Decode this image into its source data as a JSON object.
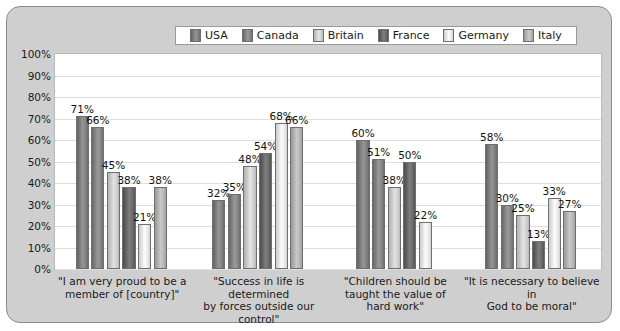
{
  "chart_data": {
    "type": "bar",
    "title": "",
    "xlabel": "",
    "ylabel": "",
    "ylim": [
      0,
      100
    ],
    "ytick_labels": [
      "100%",
      "90%",
      "80%",
      "70%",
      "60%",
      "50%",
      "40%",
      "30%",
      "20%",
      "10%",
      "0%"
    ],
    "ytick_values": [
      100,
      90,
      80,
      70,
      60,
      50,
      40,
      30,
      20,
      10,
      0
    ],
    "grid": true,
    "legend_position": "top-center",
    "categories": [
      "\"I am very proud to be a member of [country]\"",
      "\"Success in life is determined by forces outside our control\"",
      "\"Children should be taught the value of hard work\"",
      "\"It is necessary to believe in God to be moral\""
    ],
    "series": [
      {
        "name": "USA",
        "color": "#7b7b7b",
        "values": [
          71,
          32,
          60,
          58
        ]
      },
      {
        "name": "Canada",
        "color": "#808080",
        "values": [
          66,
          35,
          51,
          30
        ]
      },
      {
        "name": "Britain",
        "color": "#c9c9c9",
        "values": [
          45,
          48,
          38,
          25
        ]
      },
      {
        "name": "France",
        "color": "#646464",
        "values": [
          38,
          54,
          50,
          13
        ]
      },
      {
        "name": "Germany",
        "color": "#e3e3e3",
        "values": [
          21,
          68,
          22,
          33
        ]
      },
      {
        "name": "Italy",
        "color": "#b0b0b0",
        "values": [
          38,
          66,
          null,
          27
        ]
      }
    ],
    "data_labels": [
      [
        "71%",
        "66%",
        "45%",
        "38%",
        "21%",
        "38%"
      ],
      [
        "32%",
        "35%",
        "48%",
        "54%",
        "68%",
        "66%"
      ],
      [
        "60%",
        "51%",
        "38%",
        "50%",
        "22%",
        ""
      ],
      [
        "58%",
        "30%",
        "25%",
        "13%",
        "33%",
        "27%"
      ]
    ]
  },
  "legend": {
    "items": [
      {
        "label": "USA"
      },
      {
        "label": "Canada"
      },
      {
        "label": "Britain"
      },
      {
        "label": "France"
      },
      {
        "label": "Germany"
      },
      {
        "label": "Italy"
      }
    ]
  },
  "category_lines": [
    [
      "\"I am very proud to be a",
      "member of [country]\""
    ],
    [
      "\"Success in life is determined",
      "by forces outside our control\""
    ],
    [
      "\"Children should be",
      "taught the value of",
      "hard work\""
    ],
    [
      "\"It is necessary to believe in",
      "God to be moral\""
    ]
  ]
}
